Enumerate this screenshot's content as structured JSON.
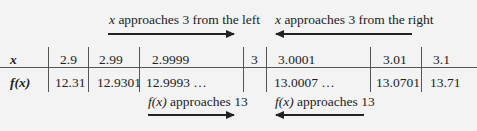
{
  "annotations": {
    "top_left": {
      "var": "x",
      "text": " approaches 3 from the left",
      "arrow": "right"
    },
    "top_right": {
      "var": "x",
      "text": " approaches 3 from the right",
      "arrow": "left"
    },
    "bottom_left": {
      "var": "f(x)",
      "text": " approaches 13",
      "arrow": "right"
    },
    "bottom_right": {
      "var": "f(x)",
      "text": " approaches 13",
      "arrow": "left"
    }
  },
  "table": {
    "row_x": {
      "label": "x",
      "values": [
        "2.9",
        "2.99",
        "2.9999",
        "3",
        "3.0001",
        "3.01",
        "3.1"
      ]
    },
    "row_fx": {
      "label": "f(x)",
      "values": [
        "12.31",
        "12.9301",
        "12.9993 …",
        "",
        "13.0007 …",
        "13.0701",
        "13.71"
      ]
    }
  }
}
